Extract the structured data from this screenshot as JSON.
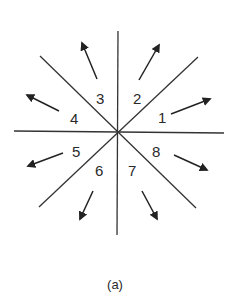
{
  "diagram": {
    "caption": "(a)",
    "center": [
      118,
      131
    ],
    "dividers": [
      {
        "name": "vertical",
        "x1": 118,
        "y1": 31,
        "x2": 117,
        "y2": 235
      },
      {
        "name": "horizontal",
        "x1": 14,
        "y1": 131,
        "x2": 224,
        "y2": 133
      },
      {
        "name": "diagonal-nw-se",
        "x1": 40,
        "y1": 56,
        "x2": 196,
        "y2": 208
      },
      {
        "name": "diagonal-ne-sw",
        "x1": 198,
        "y1": 57,
        "x2": 39,
        "y2": 207
      }
    ],
    "sectors": [
      {
        "label": "1",
        "x": 158,
        "y": 123,
        "arrow": {
          "x1": 171,
          "y1": 114,
          "x2": 210,
          "y2": 99
        }
      },
      {
        "label": "2",
        "x": 133,
        "y": 104,
        "arrow": {
          "x1": 139,
          "y1": 80,
          "x2": 159,
          "y2": 45
        }
      },
      {
        "label": "3",
        "x": 96,
        "y": 104,
        "arrow": {
          "x1": 97,
          "y1": 79,
          "x2": 82,
          "y2": 43
        }
      },
      {
        "label": "4",
        "x": 70,
        "y": 124,
        "arrow": {
          "x1": 59,
          "y1": 111,
          "x2": 27,
          "y2": 95
        }
      },
      {
        "label": "5",
        "x": 72,
        "y": 157,
        "arrow": {
          "x1": 63,
          "y1": 153,
          "x2": 28,
          "y2": 166
        }
      },
      {
        "label": "6",
        "x": 95,
        "y": 176,
        "arrow": {
          "x1": 93,
          "y1": 191,
          "x2": 80,
          "y2": 219
        }
      },
      {
        "label": "7",
        "x": 128,
        "y": 176,
        "arrow": {
          "x1": 142,
          "y1": 191,
          "x2": 157,
          "y2": 219
        }
      },
      {
        "label": "8",
        "x": 152,
        "y": 157,
        "arrow": {
          "x1": 174,
          "y1": 155,
          "x2": 207,
          "y2": 170
        }
      }
    ],
    "colors": {
      "line": "#333333",
      "arrow": "#222222",
      "text": "#2a2a2a",
      "background": "#ffffff"
    }
  }
}
